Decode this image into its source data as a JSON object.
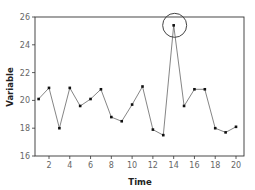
{
  "chart_data": {
    "type": "line",
    "title": "",
    "xlabel": "Time",
    "ylabel": "Variable",
    "x": [
      1,
      2,
      3,
      4,
      5,
      6,
      7,
      8,
      9,
      10,
      11,
      12,
      13,
      14,
      15,
      16,
      17,
      18,
      19,
      20
    ],
    "series": [
      {
        "name": "Variable",
        "values": [
          20.1,
          20.9,
          18.0,
          20.9,
          19.6,
          20.1,
          20.8,
          18.8,
          18.5,
          19.7,
          21.0,
          17.9,
          17.5,
          25.4,
          19.6,
          20.8,
          20.8,
          18.0,
          17.7,
          18.1
        ]
      }
    ],
    "xlim": [
      0,
      20.8
    ],
    "ylim": [
      16,
      26
    ],
    "xticks": [
      2,
      4,
      6,
      8,
      10,
      12,
      14,
      16,
      18,
      20
    ],
    "yticks": [
      16,
      18,
      20,
      22,
      24,
      26
    ],
    "xtick_labels": [
      "2",
      "4",
      "6",
      "8",
      "10",
      "12",
      "14",
      "16",
      "18",
      "20"
    ],
    "ytick_labels": [
      "16",
      "18",
      "20",
      "22",
      "24",
      "26"
    ],
    "grid": false,
    "legend": "none",
    "annotations": [
      {
        "type": "circle",
        "x": 14,
        "y": 25.4,
        "note": "outlier highlighted"
      }
    ],
    "colors": {
      "line": "#777777",
      "marker": "#111111",
      "axis": "#333333",
      "annotation": "#444444"
    }
  }
}
